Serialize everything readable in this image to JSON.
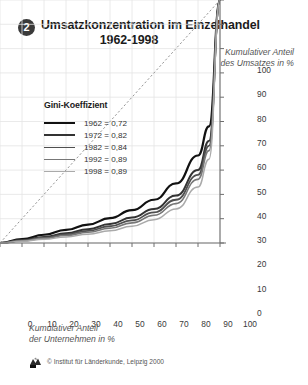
{
  "header": {
    "badge": "2",
    "title_line1": "Umsatzkonzentration im Einzelhandel",
    "title_line2": "1962-1998"
  },
  "axis_caption": {
    "y_line1": "Kumulativer Anteil",
    "y_line2": "des Umsatzes in %",
    "x_line1": "Kumulativer Anteil",
    "x_line2": "der Unternehmen in %"
  },
  "legend": {
    "title": "Gini-Koeffizient",
    "entries": [
      {
        "label": "1962 = 0,72",
        "color": "#111111",
        "width": "2.2px"
      },
      {
        "label": "1972 = 0,82",
        "color": "#333333",
        "width": "2.0px"
      },
      {
        "label": "1982 = 0,84",
        "color": "#4f4f4f",
        "width": "1.8px"
      },
      {
        "label": "1992 = 0,89",
        "color": "#777777",
        "width": "1.6px"
      },
      {
        "label": "1998 = 0,89",
        "color": "#aaaaaa",
        "width": "1.5px"
      }
    ]
  },
  "footer": {
    "text": "© Institut für Länderkunde, Leipzig 2000",
    "logo": "ifl-logo"
  },
  "chart_data": {
    "type": "line",
    "title": "Umsatzkonzentration im Einzelhandel 1962-1998",
    "xlabel": "Kumulativer Anteil der Unternehmen in %",
    "ylabel": "Kumulativer Anteil des Umsatzes in %",
    "xlim": [
      0,
      100
    ],
    "ylim": [
      0,
      100
    ],
    "xticks": [
      0,
      10,
      20,
      30,
      40,
      50,
      60,
      70,
      80,
      90,
      100
    ],
    "yticks": [
      0,
      10,
      20,
      30,
      40,
      50,
      60,
      70,
      80,
      90,
      100
    ],
    "grid": true,
    "legend_position": "upper-left",
    "reference_line": {
      "name": "Gleichverteilung",
      "style": "dashed",
      "color": "#8a8a8a",
      "x": [
        0,
        100
      ],
      "y": [
        0,
        100
      ]
    },
    "x": [
      0,
      10,
      20,
      30,
      40,
      50,
      60,
      70,
      80,
      90,
      95,
      100
    ],
    "series": [
      {
        "name": "1962",
        "gini": 0.72,
        "color": "#111111",
        "width": 2.2,
        "values": [
          0,
          1.6,
          3.4,
          5.4,
          7.6,
          10.2,
          13.5,
          17.8,
          24.5,
          36.0,
          48.0,
          100
        ]
      },
      {
        "name": "1972",
        "gini": 0.82,
        "color": "#333333",
        "width": 2.0,
        "values": [
          0,
          1.2,
          2.5,
          4.0,
          5.7,
          7.8,
          10.5,
          14.0,
          19.5,
          30.0,
          42.0,
          100
        ]
      },
      {
        "name": "1982",
        "gini": 0.84,
        "color": "#4f4f4f",
        "width": 1.8,
        "values": [
          0,
          1.0,
          2.2,
          3.5,
          5.0,
          6.9,
          9.3,
          12.6,
          17.8,
          28.0,
          40.0,
          100
        ]
      },
      {
        "name": "1992",
        "gini": 0.89,
        "color": "#777777",
        "width": 1.6,
        "values": [
          0,
          0.9,
          1.9,
          3.1,
          4.4,
          6.1,
          8.3,
          11.4,
          16.2,
          26.2,
          38.0,
          100
        ]
      },
      {
        "name": "1998",
        "gini": 0.89,
        "color": "#aaaaaa",
        "width": 1.5,
        "values": [
          0,
          0.7,
          1.5,
          2.5,
          3.6,
          5.0,
          6.9,
          9.6,
          14.0,
          23.0,
          34.5,
          100
        ]
      }
    ]
  }
}
